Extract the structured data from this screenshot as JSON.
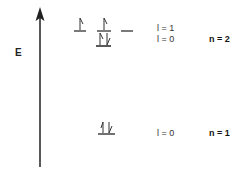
{
  "diagram": {
    "type": "orbital-energy-level-diagram",
    "axis": {
      "label": "E",
      "direction": "up"
    },
    "levels": [
      {
        "n_label": "n = 2",
        "sublevels": [
          {
            "l_label": "l = 1",
            "orbitals": [
              {
                "electrons": [
                  "up"
                ]
              },
              {
                "electrons": [
                  "up"
                ]
              },
              {
                "electrons": []
              }
            ]
          },
          {
            "l_label": "l = 0",
            "orbitals": [
              {
                "electrons": [
                  "up",
                  "down"
                ]
              }
            ]
          }
        ]
      },
      {
        "n_label": "n = 1",
        "sublevels": [
          {
            "l_label": "l = 0",
            "orbitals": [
              {
                "electrons": [
                  "up",
                  "down"
                ]
              }
            ]
          }
        ]
      }
    ]
  },
  "colors": {
    "line": "#222222",
    "background": "#ffffff"
  }
}
